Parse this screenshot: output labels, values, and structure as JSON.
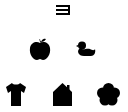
{
  "chart": {
    "rows": [
      {
        "row": 1,
        "symbols": [
          {
            "name": "tumbling-e",
            "orientation": "left"
          }
        ]
      },
      {
        "row": 2,
        "symbols": [
          {
            "name": "apple"
          },
          {
            "name": "duck"
          }
        ]
      },
      {
        "row": 3,
        "symbols": [
          {
            "name": "shirt"
          },
          {
            "name": "house"
          },
          {
            "name": "flower"
          }
        ]
      }
    ],
    "symbol_color": "#000000",
    "background_color": "#ffffff"
  }
}
